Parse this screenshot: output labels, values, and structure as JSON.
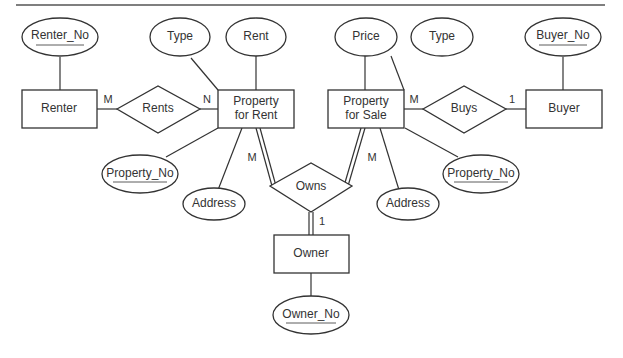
{
  "diagram": {
    "type": "ER diagram",
    "entities": {
      "renter": "Renter",
      "property_rent_1": "Property",
      "property_rent_2": "for Rent",
      "property_sale_1": "Property",
      "property_sale_2": "for Sale",
      "buyer": "Buyer",
      "owner": "Owner"
    },
    "relationships": {
      "rents": "Rents",
      "buys": "Buys",
      "owns": "Owns"
    },
    "attributes": {
      "renter_no": "Renter_No",
      "rent_type": "Type",
      "rent": "Rent",
      "rent_property_no": "Property_No",
      "rent_address": "Address",
      "price": "Price",
      "sale_type": "Type",
      "buyer_no": "Buyer_No",
      "sale_property_no": "Property_No",
      "sale_address": "Address",
      "owner_no": "Owner_No"
    },
    "cardinalities": {
      "renter_rents": "M",
      "rents_property": "N",
      "sale_buys": "M",
      "buys_buyer": "1",
      "rent_owns": "M",
      "sale_owns": "M",
      "owns_owner": "1"
    }
  }
}
